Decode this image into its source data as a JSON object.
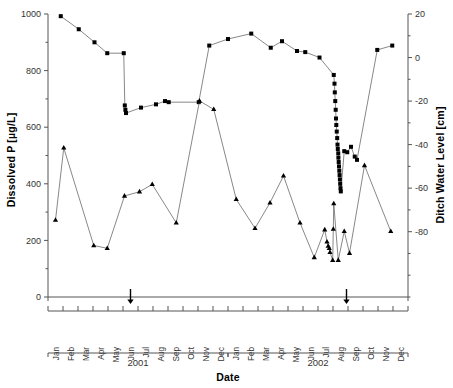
{
  "chart_data": {
    "type": "line",
    "title": "",
    "xlabel": "Date",
    "ylabel": "Dissolved P [µg/L]",
    "y2label": "Ditch Water Level [cm]",
    "ylim": [
      0,
      1000
    ],
    "yticks": [
      0,
      200,
      400,
      600,
      800,
      1000
    ],
    "y2lim": [
      -110,
      20
    ],
    "y2ticks": [
      20,
      0,
      -20,
      -40,
      -60,
      -80
    ],
    "grid": false,
    "legend": "none",
    "x_tick_labels": [
      "Jan",
      "Feb",
      "Mar",
      "Apr",
      "May",
      "Jun",
      "Jul",
      "Aug",
      "Sep",
      "Oct",
      "Nov",
      "Dec",
      "Jan",
      "Feb",
      "Mar",
      "Apr",
      "May",
      "Jun",
      "Jul",
      "Aug",
      "Sep",
      "Oct",
      "Nov",
      "Dec"
    ],
    "x_group_labels": [
      "2001",
      "2002"
    ],
    "annotations": [
      {
        "name": "treatment-arrow-1",
        "x_month": "Jun",
        "x_year": "2001",
        "x_index": 5.0,
        "symbol": "down-arrow"
      },
      {
        "name": "treatment-arrow-2",
        "x_month": "Aug",
        "x_year": "2002",
        "x_index": 19.4,
        "symbol": "down-arrow"
      }
    ],
    "series": [
      {
        "name": "Ditch Water Level [cm]",
        "axis": "right",
        "marker": "square",
        "unit": "cm",
        "points": [
          {
            "x": 0.35,
            "y": 19.0
          },
          {
            "x": 1.55,
            "y": 13.0
          },
          {
            "x": 2.6,
            "y": 7.0
          },
          {
            "x": 3.45,
            "y": 2.0
          },
          {
            "x": 4.55,
            "y": 2.0
          },
          {
            "x": 4.62,
            "y": -22.0
          },
          {
            "x": 4.66,
            "y": -24.0
          },
          {
            "x": 4.7,
            "y": -25.5
          },
          {
            "x": 5.7,
            "y": -23.0
          },
          {
            "x": 6.7,
            "y": -21.5
          },
          {
            "x": 7.3,
            "y": -20.0
          },
          {
            "x": 7.55,
            "y": -20.5
          },
          {
            "x": 9.55,
            "y": -20.5
          },
          {
            "x": 10.25,
            "y": 5.5
          },
          {
            "x": 11.5,
            "y": 8.5
          },
          {
            "x": 13.05,
            "y": 11.0
          },
          {
            "x": 14.35,
            "y": 4.5
          },
          {
            "x": 15.1,
            "y": 7.5
          },
          {
            "x": 16.1,
            "y": 3.0
          },
          {
            "x": 16.65,
            "y": 2.5
          },
          {
            "x": 17.6,
            "y": 0.0
          },
          {
            "x": 18.55,
            "y": -8.0
          },
          {
            "x": 18.6,
            "y": -12.0
          },
          {
            "x": 18.62,
            "y": -16.0
          },
          {
            "x": 18.65,
            "y": -20.0
          },
          {
            "x": 18.68,
            "y": -24.0
          },
          {
            "x": 18.7,
            "y": -28.0
          },
          {
            "x": 18.72,
            "y": -31.0
          },
          {
            "x": 18.75,
            "y": -34.0
          },
          {
            "x": 18.78,
            "y": -37.0
          },
          {
            "x": 18.8,
            "y": -40.0
          },
          {
            "x": 18.82,
            "y": -42.0
          },
          {
            "x": 18.85,
            "y": -44.0
          },
          {
            "x": 18.86,
            "y": -46.0
          },
          {
            "x": 18.88,
            "y": -48.0
          },
          {
            "x": 18.9,
            "y": -50.0
          },
          {
            "x": 18.92,
            "y": -52.0
          },
          {
            "x": 18.94,
            "y": -54.0
          },
          {
            "x": 18.96,
            "y": -56.0
          },
          {
            "x": 18.98,
            "y": -58.0
          },
          {
            "x": 19.0,
            "y": -60.0
          },
          {
            "x": 19.02,
            "y": -61.5
          },
          {
            "x": 19.25,
            "y": -43.0
          },
          {
            "x": 19.45,
            "y": -43.5
          },
          {
            "x": 19.7,
            "y": -41.0
          },
          {
            "x": 19.95,
            "y": -45.5
          },
          {
            "x": 20.1,
            "y": -47.0
          },
          {
            "x": 21.45,
            "y": 3.5
          },
          {
            "x": 22.45,
            "y": 5.5
          }
        ]
      },
      {
        "name": "Dissolved P [µg/L]",
        "axis": "left",
        "marker": "triangle",
        "unit": "µg/L",
        "points": [
          {
            "x": 0.0,
            "y": 272
          },
          {
            "x": 0.55,
            "y": 527
          },
          {
            "x": 2.55,
            "y": 182
          },
          {
            "x": 3.45,
            "y": 172
          },
          {
            "x": 4.6,
            "y": 357
          },
          {
            "x": 5.6,
            "y": 372
          },
          {
            "x": 6.45,
            "y": 398
          },
          {
            "x": 8.05,
            "y": 262
          },
          {
            "x": 9.6,
            "y": 693
          },
          {
            "x": 10.55,
            "y": 663
          },
          {
            "x": 12.05,
            "y": 345
          },
          {
            "x": 13.3,
            "y": 243
          },
          {
            "x": 14.3,
            "y": 333
          },
          {
            "x": 15.2,
            "y": 428
          },
          {
            "x": 16.3,
            "y": 262
          },
          {
            "x": 17.25,
            "y": 140
          },
          {
            "x": 17.95,
            "y": 238
          },
          {
            "x": 18.1,
            "y": 195
          },
          {
            "x": 18.18,
            "y": 180
          },
          {
            "x": 18.25,
            "y": 172
          },
          {
            "x": 18.3,
            "y": 158
          },
          {
            "x": 18.48,
            "y": 130
          },
          {
            "x": 18.52,
            "y": 240
          },
          {
            "x": 18.55,
            "y": 330
          },
          {
            "x": 18.85,
            "y": 130
          },
          {
            "x": 19.25,
            "y": 232
          },
          {
            "x": 19.6,
            "y": 155
          },
          {
            "x": 20.6,
            "y": 465
          },
          {
            "x": 22.35,
            "y": 232
          }
        ]
      }
    ]
  }
}
